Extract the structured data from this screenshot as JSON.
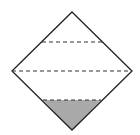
{
  "diagram": {
    "shape": "diamond",
    "vertices": {
      "top": [
        72,
        12
      ],
      "right": [
        132,
        71
      ],
      "bottom": [
        72,
        130
      ],
      "left": [
        12,
        71
      ]
    },
    "dashed_lines": [
      {
        "y": 42,
        "x1": 42,
        "x2": 102
      },
      {
        "y": 71,
        "x1": 12,
        "x2": 132
      },
      {
        "y": 100,
        "x1": 43,
        "x2": 101
      }
    ],
    "shaded_region": {
      "description": "bottom triangle below lowest dashed line",
      "color": "#a9a9a9"
    },
    "stroke_color": "#222222"
  }
}
